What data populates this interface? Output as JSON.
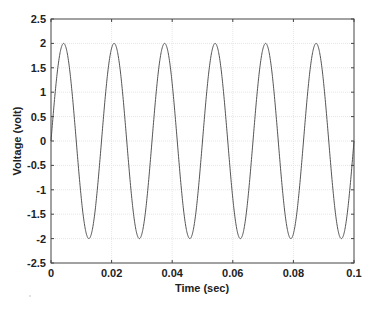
{
  "chart_data": {
    "type": "line",
    "title": "",
    "xlabel": "Time (sec)",
    "ylabel": "Voltage (volt)",
    "xlim": [
      0,
      0.1
    ],
    "ylim": [
      -2.5,
      2.5
    ],
    "xticks": [
      0,
      0.02,
      0.04,
      0.06,
      0.08,
      0.1
    ],
    "xtick_labels": [
      "0",
      "0.02",
      "0.04",
      "0.06",
      "0.08",
      "0.1"
    ],
    "yticks": [
      2.5,
      2,
      1.5,
      1,
      0.5,
      0,
      -0.5,
      -1,
      -1.5,
      -2,
      -2.5
    ],
    "ytick_labels": [
      "2.5",
      "2",
      "1.5",
      "1",
      "0.5",
      "0",
      "-0.5",
      "-1",
      "-1.5",
      "-2",
      "-2.5"
    ],
    "grid": true,
    "legend": null,
    "series": [
      {
        "name": "Voltage",
        "function": "2*sin(2*pi*60*t)",
        "amplitude": 2,
        "frequency_hz": 60,
        "x": [
          0,
          0.004167,
          0.008333,
          0.0125,
          0.016667,
          0.020833,
          0.025,
          0.029167,
          0.033333,
          0.0375,
          0.041667,
          0.045833,
          0.05,
          0.054167,
          0.058333,
          0.0625,
          0.066667,
          0.070833,
          0.075,
          0.079167,
          0.083333,
          0.0875,
          0.091667,
          0.095833,
          0.1
        ],
        "values": [
          0,
          2,
          0,
          -2,
          0,
          2,
          0,
          -2,
          0,
          2,
          0,
          -2,
          0,
          2,
          0,
          -2,
          0,
          2,
          0,
          -2,
          0,
          2,
          0,
          -2,
          0
        ]
      }
    ]
  },
  "colors": {
    "line": "#555555",
    "axes": "#444444",
    "grid": "#e6e6e6",
    "text": "#222222"
  }
}
